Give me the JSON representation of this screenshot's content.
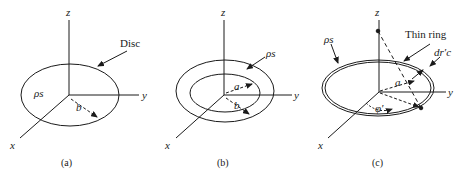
{
  "figure": {
    "panels": [
      {
        "id": "a",
        "caption": "(a)",
        "axes": {
          "z": "z",
          "y": "y",
          "x": "x"
        },
        "callout": "Disc",
        "density_label": "ρs",
        "radius_label": "b"
      },
      {
        "id": "b",
        "caption": "(b)",
        "axes": {
          "z": "z",
          "y": "y",
          "x": "x"
        },
        "density_label": "ρs",
        "inner_radius_label": "a",
        "outer_radius_label": "b"
      },
      {
        "id": "c",
        "caption": "(c)",
        "axes": {
          "z": "z",
          "y": "y",
          "x": "x"
        },
        "callout": "Thin ring",
        "density_label": "ρs",
        "width_label": "dr′c",
        "radius_label": "a",
        "angle_label": "φ′"
      }
    ],
    "colors": {
      "line": "#1a1a1a",
      "background": "#ffffff"
    }
  }
}
